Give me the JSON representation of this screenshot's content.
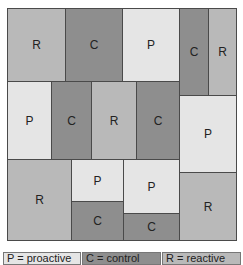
{
  "diagram": {
    "type": "treemap-mosaic",
    "colors": {
      "P": "#e5e5e5",
      "C": "#8e8e8e",
      "R": "#b9b9b9",
      "border": "#4a4a4a"
    },
    "cells": [
      {
        "id": "r1a",
        "label": "R",
        "type": "R",
        "x": 0,
        "y": 0,
        "w": 59,
        "h": 74
      },
      {
        "id": "r1b",
        "label": "C",
        "type": "C",
        "x": 58,
        "y": 0,
        "w": 58,
        "h": 74
      },
      {
        "id": "r1c",
        "label": "P",
        "type": "P",
        "x": 115,
        "y": 0,
        "w": 58,
        "h": 74
      },
      {
        "id": "r1d",
        "label": "C",
        "type": "C",
        "x": 172,
        "y": 0,
        "w": 30,
        "h": 88
      },
      {
        "id": "r1e",
        "label": "R",
        "type": "R",
        "x": 201,
        "y": 0,
        "w": 29,
        "h": 88
      },
      {
        "id": "r2a",
        "label": "P",
        "type": "P",
        "x": 0,
        "y": 73,
        "w": 45,
        "h": 79
      },
      {
        "id": "r2b",
        "label": "C",
        "type": "C",
        "x": 44,
        "y": 73,
        "w": 41,
        "h": 79
      },
      {
        "id": "r2c",
        "label": "R",
        "type": "R",
        "x": 84,
        "y": 73,
        "w": 46,
        "h": 79
      },
      {
        "id": "r2d",
        "label": "C",
        "type": "C",
        "x": 129,
        "y": 73,
        "w": 44,
        "h": 79
      },
      {
        "id": "r2e",
        "label": "P",
        "type": "P",
        "x": 172,
        "y": 87,
        "w": 58,
        "h": 78
      },
      {
        "id": "r3a",
        "label": "R",
        "type": "R",
        "x": 0,
        "y": 151,
        "w": 65,
        "h": 82
      },
      {
        "id": "r3b",
        "label": "P",
        "type": "P",
        "x": 64,
        "y": 151,
        "w": 53,
        "h": 43
      },
      {
        "id": "r3c",
        "label": "C",
        "type": "C",
        "x": 64,
        "y": 193,
        "w": 53,
        "h": 40
      },
      {
        "id": "r3d",
        "label": "P",
        "type": "P",
        "x": 116,
        "y": 151,
        "w": 57,
        "h": 55
      },
      {
        "id": "r3e",
        "label": "C",
        "type": "C",
        "x": 116,
        "y": 205,
        "w": 57,
        "h": 28
      },
      {
        "id": "r3f",
        "label": "R",
        "type": "R",
        "x": 172,
        "y": 164,
        "w": 58,
        "h": 69
      }
    ]
  },
  "legend": [
    {
      "key": "P",
      "text": "P = proactive",
      "type": "P",
      "x": 0,
      "w": 78
    },
    {
      "key": "C",
      "text": "C = control",
      "type": "C",
      "x": 79,
      "w": 79
    },
    {
      "key": "R",
      "text": "R = reactive",
      "type": "R",
      "x": 159,
      "w": 79
    }
  ]
}
